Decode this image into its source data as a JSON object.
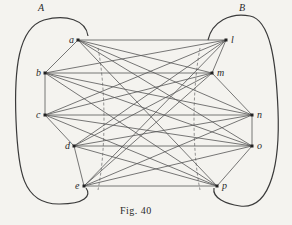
{
  "figure": {
    "caption": "Fig. 40",
    "group_labels": {
      "A": "A",
      "B": "B"
    },
    "colors": {
      "line": "#555555",
      "curve": "#3a3a3a",
      "background": "#f4f3ef"
    },
    "nodes": [
      {
        "id": "a",
        "label": "a",
        "x": 78,
        "y": 40,
        "group": "A"
      },
      {
        "id": "b",
        "label": "b",
        "x": 45,
        "y": 73,
        "group": "A"
      },
      {
        "id": "c",
        "label": "c",
        "x": 45,
        "y": 115,
        "group": "A"
      },
      {
        "id": "d",
        "label": "d",
        "x": 74,
        "y": 146,
        "group": "A"
      },
      {
        "id": "e",
        "label": "e",
        "x": 84,
        "y": 186,
        "group": "A"
      },
      {
        "id": "l",
        "label": "l",
        "x": 226,
        "y": 40,
        "group": "B"
      },
      {
        "id": "m",
        "label": "m",
        "x": 212,
        "y": 73,
        "group": "B"
      },
      {
        "id": "n",
        "label": "n",
        "x": 252,
        "y": 115,
        "group": "B"
      },
      {
        "id": "o",
        "label": "o",
        "x": 252,
        "y": 146,
        "group": "B"
      },
      {
        "id": "p",
        "label": "p",
        "x": 217,
        "y": 186,
        "group": "B"
      }
    ]
  }
}
